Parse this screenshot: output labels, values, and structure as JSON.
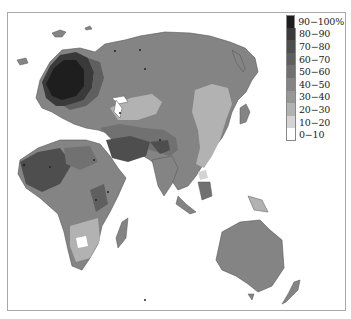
{
  "map": {
    "type": "choropleth",
    "region": "Europe, Asia, Africa, Oceania",
    "colormap": "greyscale"
  },
  "legend": {
    "items": [
      {
        "label": "90−100%",
        "color": "#1e1e1e"
      },
      {
        "label": "80−90",
        "color": "#3a3a3a"
      },
      {
        "label": "70−80",
        "color": "#4e4e4e"
      },
      {
        "label": "60−70",
        "color": "#5f5f5f"
      },
      {
        "label": "50−60",
        "color": "#717171"
      },
      {
        "label": "40−50",
        "color": "#848484"
      },
      {
        "label": "30−40",
        "color": "#979797"
      },
      {
        "label": "20−30",
        "color": "#b2b2b2"
      },
      {
        "label": "10−20",
        "color": "#d4d4d4"
      },
      {
        "label": "0−10",
        "color": "#ffffff"
      }
    ]
  }
}
